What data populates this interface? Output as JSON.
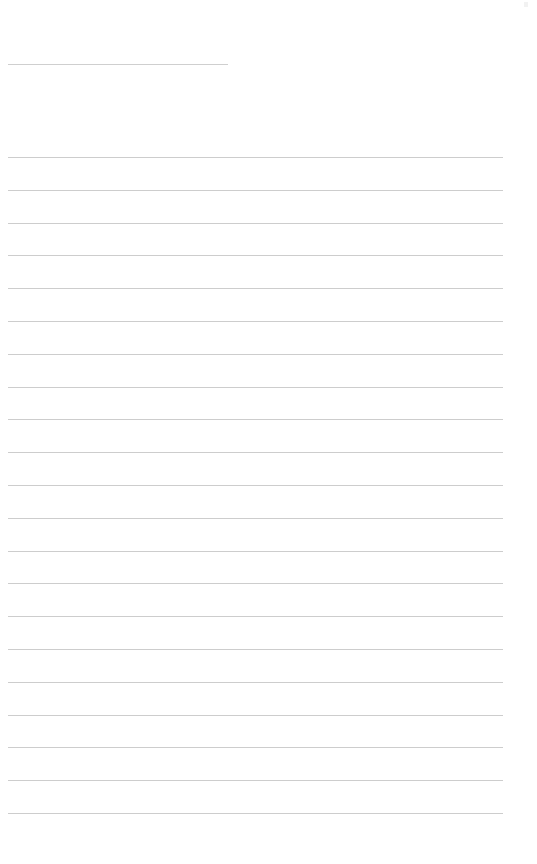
{
  "page": {
    "type": "blank lined paper",
    "title_line": {
      "x": 8,
      "y": 64,
      "width": 220
    },
    "ruled_lines": {
      "count": 21,
      "first_y": 157,
      "spacing": 32.8,
      "x": 8,
      "width": 495,
      "color": "#cdcdcd"
    },
    "background": "#ffffff"
  }
}
